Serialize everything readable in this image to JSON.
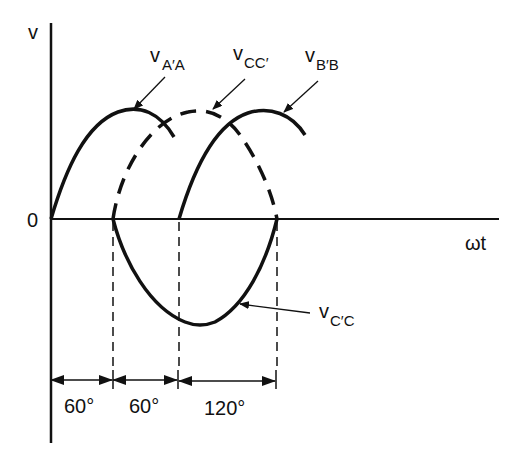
{
  "figure": {
    "axes": {
      "y_label": "v",
      "x_label": "ωt",
      "origin_label": "0"
    },
    "curves": [
      {
        "id": "vAA",
        "label_main": "v",
        "label_sub": "A′A",
        "style": "solid",
        "description": "phase A voltage, starts at 0°"
      },
      {
        "id": "vCC",
        "label_main": "v",
        "label_sub": "CC′",
        "style": "dashed",
        "description": "phase C voltage, starts at 60°"
      },
      {
        "id": "vBB",
        "label_main": "v",
        "label_sub": "B′B",
        "style": "solid",
        "description": "phase B voltage, starts at 120°"
      },
      {
        "id": "vCpC",
        "label_main": "v",
        "label_sub": "C′C",
        "style": "solid",
        "description": "negative lobe from 60° to 240°"
      }
    ],
    "intervals": [
      {
        "label": "60°"
      },
      {
        "label": "60°"
      },
      {
        "label": "120°"
      }
    ],
    "colors": {
      "ink": "#111111",
      "background": "#ffffff"
    }
  }
}
